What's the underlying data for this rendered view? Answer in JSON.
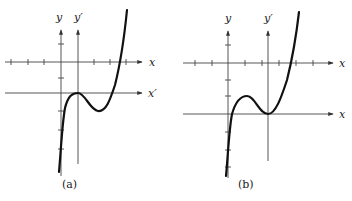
{
  "figure": {
    "panels": [
      {
        "id": "a",
        "caption": "(a)",
        "labels": {
          "y": "y",
          "y_prime": "y′",
          "x": "x",
          "x_prime": "x′"
        },
        "description": "Cubic curve with local maximum touching the x′-axis at the y′-axis"
      },
      {
        "id": "b",
        "caption": "(b)",
        "labels": {
          "y": "y",
          "y_prime": "y′",
          "x": "x",
          "x_bottom": "x"
        },
        "description": "Cubic curve with local minimum touching the lower axis at the y′-axis"
      }
    ]
  }
}
